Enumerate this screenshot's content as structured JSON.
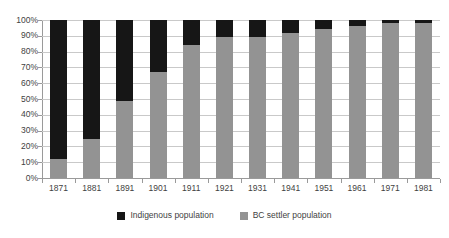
{
  "chart_data": {
    "type": "bar",
    "title": "",
    "subtitle": "",
    "xlabel": "",
    "ylabel": "",
    "stacked": true,
    "stack_total": 100,
    "grid": true,
    "legend_position": "bottom",
    "ylim": [
      0,
      100
    ],
    "ytick_labels": [
      "100%",
      "90%",
      "80%",
      "70%",
      "60%",
      "50%",
      "40%",
      "30%",
      "20%",
      "10%",
      "0%"
    ],
    "ytick_values": [
      100,
      90,
      80,
      70,
      60,
      50,
      40,
      30,
      20,
      10,
      0
    ],
    "categories": [
      "1871",
      "1881",
      "1891",
      "1901",
      "1911",
      "1921",
      "1931",
      "1941",
      "1951",
      "1961",
      "1971",
      "1981"
    ],
    "series": [
      {
        "name": "BC settler population",
        "color": "#939393",
        "values": [
          12,
          24.5,
          49,
          67,
          84,
          89,
          89,
          91.5,
          94.5,
          96.5,
          98,
          98
        ]
      },
      {
        "name": "Indigenous population",
        "color": "#161616",
        "values": [
          88,
          75.5,
          51,
          33,
          16,
          11,
          11,
          8.5,
          5.5,
          3.5,
          2,
          2
        ]
      }
    ]
  },
  "legend": {
    "items": [
      {
        "label": "Indigenous population",
        "swatch": "#161616"
      },
      {
        "label": "BC settler population",
        "swatch": "#939393"
      }
    ]
  }
}
